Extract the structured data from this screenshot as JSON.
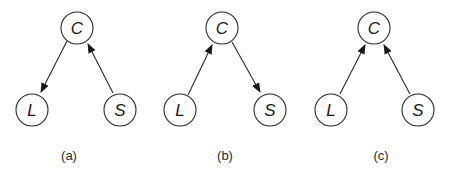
{
  "figure": {
    "panels": [
      {
        "caption": "(a)",
        "nodes": [
          {
            "id": "C",
            "label": "C"
          },
          {
            "id": "L",
            "label": "L"
          },
          {
            "id": "S",
            "label": "S"
          }
        ],
        "edges": [
          {
            "from": "C",
            "to": "L"
          },
          {
            "from": "S",
            "to": "C"
          }
        ]
      },
      {
        "caption": "(b)",
        "nodes": [
          {
            "id": "C",
            "label": "C"
          },
          {
            "id": "L",
            "label": "L"
          },
          {
            "id": "S",
            "label": "S"
          }
        ],
        "edges": [
          {
            "from": "L",
            "to": "C"
          },
          {
            "from": "C",
            "to": "S"
          }
        ]
      },
      {
        "caption": "(c)",
        "nodes": [
          {
            "id": "C",
            "label": "C"
          },
          {
            "id": "L",
            "label": "L"
          },
          {
            "id": "S",
            "label": "S"
          }
        ],
        "edges": [
          {
            "from": "L",
            "to": "C"
          },
          {
            "from": "S",
            "to": "C"
          }
        ]
      }
    ],
    "colors": {
      "stroke": "#2a2a2a",
      "background": "#ffffff"
    }
  }
}
